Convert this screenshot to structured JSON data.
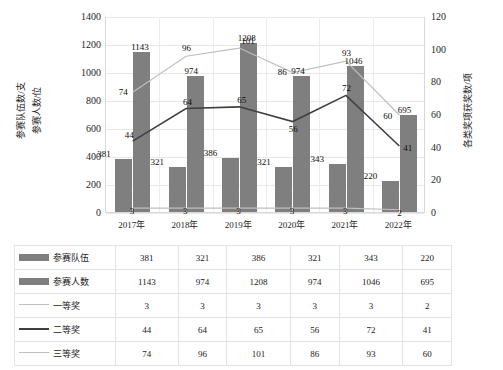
{
  "chart_data": {
    "type": "bar",
    "title": "",
    "xlabel": "",
    "ylabel": "参赛队伍数/支  参赛人数/位",
    "y2label": "各类奖项获奖数/项",
    "categories": [
      "2017年",
      "2018年",
      "2019年",
      "2020年",
      "2021年",
      "2022年"
    ],
    "ylim": [
      0,
      1400
    ],
    "y2lim": [
      0,
      120
    ],
    "yticks": [
      "0",
      "200",
      "400",
      "600",
      "800",
      "1000",
      "1200",
      "1400"
    ],
    "y2ticks": [
      "0",
      "20",
      "40",
      "60",
      "80",
      "100",
      "120"
    ],
    "grid": true,
    "legend_position": "table-below",
    "series": [
      {
        "name": "参赛队伍",
        "type": "bar",
        "axis": "left",
        "color": "#7f7f7f",
        "values": [
          381,
          321,
          386,
          321,
          343,
          220
        ]
      },
      {
        "name": "参赛人数",
        "type": "bar",
        "axis": "left",
        "color": "#7f7f7f",
        "values": [
          1143,
          974,
          1208,
          974,
          1046,
          695
        ]
      },
      {
        "name": "一等奖",
        "type": "line",
        "axis": "right",
        "color": "#bfbfbf",
        "values": [
          3,
          3,
          3,
          3,
          3,
          2
        ]
      },
      {
        "name": "二等奖",
        "type": "line",
        "axis": "right",
        "color": "#404040",
        "values": [
          44,
          64,
          65,
          56,
          72,
          41
        ]
      },
      {
        "name": "三等奖",
        "type": "line",
        "axis": "right",
        "color": "#bfbfbf",
        "values": [
          74,
          96,
          101,
          86,
          93,
          60
        ]
      }
    ]
  },
  "axis_titles": {
    "left_1": "参赛队伍数/支",
    "left_2": "参赛人数/位",
    "right_1": "各类奖项获奖数/项"
  },
  "table": {
    "rows": [
      {
        "label": "参赛队伍",
        "marker": "bar-swatch",
        "values": [
          "381",
          "321",
          "386",
          "321",
          "343",
          "220"
        ]
      },
      {
        "label": "参赛人数",
        "marker": "bar-swatch",
        "values": [
          "1143",
          "974",
          "1208",
          "974",
          "1046",
          "695"
        ]
      },
      {
        "label": "一等奖",
        "marker": "line-light",
        "values": [
          "3",
          "3",
          "3",
          "3",
          "3",
          "2"
        ]
      },
      {
        "label": "二等奖",
        "marker": "line-dark",
        "values": [
          "44",
          "64",
          "65",
          "56",
          "72",
          "41"
        ]
      },
      {
        "label": "三等奖",
        "marker": "line-light",
        "values": [
          "74",
          "96",
          "101",
          "86",
          "93",
          "60"
        ]
      }
    ]
  },
  "colors": {
    "bar": "#7f7f7f",
    "line_light": "#bfbfbf",
    "line_dark": "#404040",
    "grid": "#e8e8e8",
    "table_border": "#e3e3e3"
  }
}
